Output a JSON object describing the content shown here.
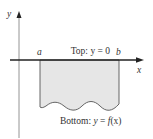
{
  "diagram": {
    "axes": {
      "x_label": "x",
      "y_label": "y"
    },
    "endpoints": {
      "left": "a",
      "right": "b"
    },
    "top_label": {
      "prefix": "Top: ",
      "equation": "y = 0"
    },
    "bottom_label": {
      "prefix": "Bottom: ",
      "equation_y": "y",
      "equation_eq": " = ",
      "equation_f": "f",
      "equation_arg": "(x)"
    },
    "colors": {
      "region_fill": "#e6e6e6",
      "axis": "#222222",
      "text": "#333333"
    }
  }
}
